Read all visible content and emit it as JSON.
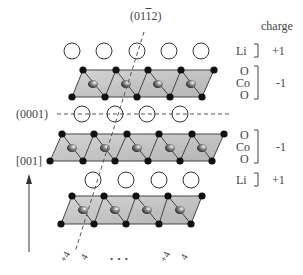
{
  "labels": {
    "plane_0112_prefix": "(01",
    "plane_0112_bar": "1",
    "plane_0112_suffix": "2)",
    "plane_0001": "(0001)",
    "direction_001": "[001]",
    "charge_header": "charge",
    "ellipsis": "• • •"
  },
  "legend": {
    "rows": [
      {
        "species": [
          "Li"
        ],
        "charge": "+1"
      },
      {
        "species": [
          "O",
          "Co",
          "O"
        ],
        "charge": "-1"
      },
      {
        "species": [
          "O",
          "Co",
          "O"
        ],
        "charge": "-1"
      },
      {
        "species": [
          "Li"
        ],
        "charge": "+1"
      }
    ]
  },
  "surface_marks": [
    "+4",
    "4",
    "+4",
    "4"
  ],
  "colors": {
    "octahedron_fill": "#c8c8c8",
    "octahedron_dark": "#a8a8a8",
    "atom_O": "#111111",
    "atom_Co": "#333333",
    "li_stroke": "#333333",
    "line": "#444444"
  }
}
